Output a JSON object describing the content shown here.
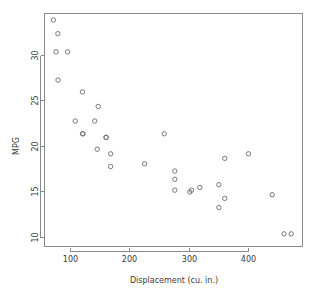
{
  "chart_data": {
    "type": "scatter",
    "title": "",
    "subtitle": "",
    "xlabel": "Displacement (cu. in.)",
    "ylabel": "MPG",
    "xlim": [
      60,
      485
    ],
    "ylim": [
      9.0,
      34.8
    ],
    "grid": false,
    "legend": null,
    "xticks": [
      100,
      200,
      300,
      400
    ],
    "xtick_labels": [
      "100",
      "200",
      "300",
      "400"
    ],
    "yticks": [
      10,
      15,
      20,
      25,
      30
    ],
    "ytick_labels": [
      "10",
      "15",
      "20",
      "25",
      "30"
    ],
    "marker": "open-circle",
    "marker_color": "#6b6b6b",
    "points": [
      {
        "x": 71.1,
        "y": 33.9
      },
      {
        "x": 78.7,
        "y": 32.4
      },
      {
        "x": 75.7,
        "y": 30.4
      },
      {
        "x": 95.1,
        "y": 30.4
      },
      {
        "x": 79.0,
        "y": 27.3
      },
      {
        "x": 120.1,
        "y": 26.0
      },
      {
        "x": 146.7,
        "y": 24.4
      },
      {
        "x": 108.0,
        "y": 22.8
      },
      {
        "x": 140.8,
        "y": 22.8
      },
      {
        "x": 120.3,
        "y": 21.4
      },
      {
        "x": 121.0,
        "y": 21.4
      },
      {
        "x": 160.0,
        "y": 21.0
      },
      {
        "x": 160.0,
        "y": 21.0
      },
      {
        "x": 258.0,
        "y": 21.4
      },
      {
        "x": 145.0,
        "y": 19.7
      },
      {
        "x": 167.6,
        "y": 19.2
      },
      {
        "x": 167.6,
        "y": 17.8
      },
      {
        "x": 225.0,
        "y": 18.1
      },
      {
        "x": 360.0,
        "y": 18.7
      },
      {
        "x": 400.0,
        "y": 19.2
      },
      {
        "x": 275.8,
        "y": 17.3
      },
      {
        "x": 275.8,
        "y": 16.4
      },
      {
        "x": 275.8,
        "y": 15.2
      },
      {
        "x": 301.0,
        "y": 15.0
      },
      {
        "x": 304.0,
        "y": 15.2
      },
      {
        "x": 318.0,
        "y": 15.5
      },
      {
        "x": 350.0,
        "y": 15.8
      },
      {
        "x": 360.0,
        "y": 14.3
      },
      {
        "x": 350.0,
        "y": 13.3
      },
      {
        "x": 440.0,
        "y": 14.7
      },
      {
        "x": 460.0,
        "y": 10.4
      },
      {
        "x": 472.0,
        "y": 10.4
      }
    ]
  },
  "plot": {
    "box_left": 44,
    "box_top": 13,
    "box_right": 303,
    "box_bottom": 247
  }
}
